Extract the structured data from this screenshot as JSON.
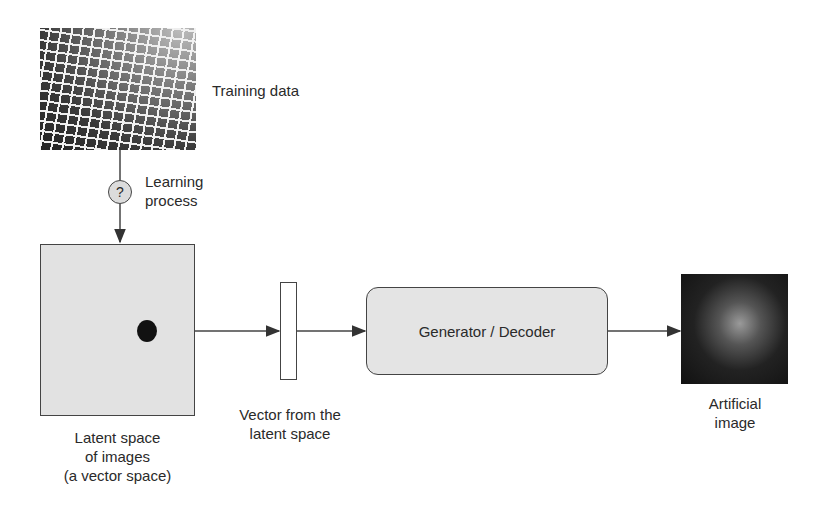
{
  "diagram": {
    "training_data": {
      "label": "Training data",
      "image": "grid-of-face-photos"
    },
    "learning_process": {
      "symbol": "?",
      "label_line1": "Learning",
      "label_line2": "process"
    },
    "latent_space": {
      "label_line1": "Latent space",
      "label_line2": "of images",
      "label_line3": "(a vector space)"
    },
    "vector": {
      "label_line1": "Vector from the",
      "label_line2": "latent space"
    },
    "generator": {
      "label": "Generator / Decoder"
    },
    "output": {
      "label_line1": "Artificial",
      "label_line2": "image",
      "image": "generated-face-portrait"
    }
  },
  "colors": {
    "stroke": "#444444",
    "box_fill": "#e2e2e2",
    "text": "#2a2a2a",
    "point": "#111111"
  }
}
